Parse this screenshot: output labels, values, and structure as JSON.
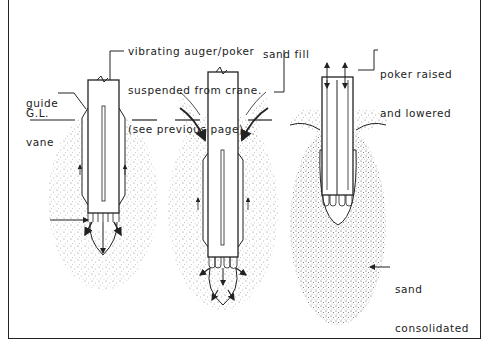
{
  "labels": {
    "auger_line1": "vibrating auger/poker",
    "auger_line2": "suspended from crane.",
    "auger_line3": "(see previous page)",
    "guide_line1": "guide",
    "guide_line2": "vane",
    "ground_level": "G.L.",
    "sand_fill": "sand fill",
    "poker_line1": "poker raised",
    "poker_line2": "and lowered",
    "sand_line1": "sand",
    "sand_line2": "consolidated"
  },
  "stages": [
    {
      "id": "stage-1",
      "description": "poker penetrating with water jets"
    },
    {
      "id": "stage-2",
      "description": "sand fill fed alongside poker"
    },
    {
      "id": "stage-3",
      "description": "poker raised and lowered, sand consolidated"
    }
  ]
}
